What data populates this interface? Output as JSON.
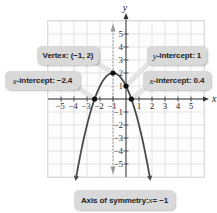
{
  "chart_data": {
    "type": "line",
    "title": "",
    "function": "y = -(x + 1)^2 + 2",
    "xlabel": "x",
    "ylabel": "y",
    "xlim": [
      -6,
      6
    ],
    "ylim": [
      -6,
      6
    ],
    "grid": true,
    "x_ticks": [
      -5,
      -4,
      -3,
      -2,
      -1,
      1,
      2,
      3,
      4,
      5
    ],
    "y_ticks": [
      -5,
      -4,
      -3,
      -2,
      -1,
      1,
      2,
      3,
      4,
      5
    ],
    "series": [
      {
        "name": "parabola",
        "x": [
          -4.3,
          -4,
          -3.5,
          -3,
          -2.414,
          -2,
          -1.5,
          -1,
          -0.5,
          0,
          0.414,
          1,
          1.5,
          2,
          2.3
        ],
        "y": [
          -8.89,
          -7,
          -4.25,
          -2,
          0,
          1,
          1.75,
          2,
          1.75,
          1,
          0,
          -2,
          -4.25,
          -7,
          -8.89
        ]
      }
    ],
    "points": [
      {
        "label": "Vertex",
        "x": -1,
        "y": 2
      },
      {
        "label": "y-intercept",
        "x": 0,
        "y": 1
      },
      {
        "label": "x-intercept",
        "x": -2.4,
        "y": 0
      },
      {
        "label": "x-intercept",
        "x": 0.4,
        "y": 0
      }
    ],
    "axis_of_symmetry": -1,
    "annotations": [
      "Vertex: (−1, 2)",
      "y-intercept: 1",
      "x-intercept: −2.4",
      "x-intercept: 0.4",
      "Axis of symmetry: x = −1"
    ]
  },
  "labels": {
    "vertex_prefix": "Vertex: ",
    "vertex_value": "(−1, 2)",
    "y_int_var": "y",
    "y_int_text": "-intercept: 1",
    "x_int_left_var": "x",
    "x_int_left_text": "-intercept: −2.4",
    "x_int_right_var": "x",
    "x_int_right_text": "-intercept: 0.4",
    "axis_text": "Axis of symmetry: ",
    "axis_var": "x",
    "axis_eq": " = −1"
  },
  "colors": {
    "curve": "#4a4a4a",
    "grid": "#dcdcdc",
    "axis": "#333333",
    "callout_bg": "#d9d9d9",
    "symmetry_line": "#9a9a9a"
  }
}
